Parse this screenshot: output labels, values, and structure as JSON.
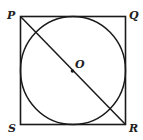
{
  "figure": {
    "labels": {
      "P": "P",
      "Q": "Q",
      "R": "R",
      "S": "S",
      "O": "O"
    }
  }
}
